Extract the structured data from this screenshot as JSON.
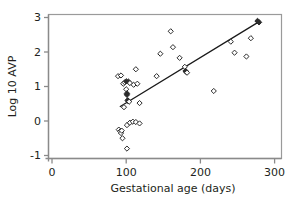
{
  "chart_data": {
    "type": "scatter",
    "title": "",
    "xlabel": "Gestational age (days)",
    "ylabel": "Log 10 AVP",
    "xlim": [
      0,
      310
    ],
    "ylim": [
      -1.35,
      3.2
    ],
    "xticks": [
      0,
      100,
      200,
      300
    ],
    "xticklabels": [
      "0",
      "100",
      "200",
      "300"
    ],
    "yticks": [
      -1,
      0,
      1,
      2,
      3
    ],
    "yticklabels": [
      "-1",
      "0",
      "1",
      "2",
      "3"
    ],
    "grid": false,
    "legend": null,
    "marker": "diamond-open",
    "series": [
      {
        "name": "AVP vs gestational age",
        "marker": "diamond",
        "points": [
          {
            "x": 89,
            "y": 1.3,
            "filled": false
          },
          {
            "x": 93,
            "y": 1.32,
            "filled": false
          },
          {
            "x": 96,
            "y": 1.08,
            "filled": false
          },
          {
            "x": 98,
            "y": 1.12,
            "filled": false
          },
          {
            "x": 100,
            "y": 1.15,
            "filled": true
          },
          {
            "x": 103,
            "y": 1.14,
            "filled": true
          },
          {
            "x": 105,
            "y": 1.1,
            "filled": false
          },
          {
            "x": 100,
            "y": 0.92,
            "filled": false
          },
          {
            "x": 101,
            "y": 0.8,
            "filled": true
          },
          {
            "x": 101,
            "y": 0.76,
            "filled": true
          },
          {
            "x": 102,
            "y": 0.6,
            "filled": true
          },
          {
            "x": 103,
            "y": 0.57,
            "filled": true
          },
          {
            "x": 104,
            "y": 0.56,
            "filled": false
          },
          {
            "x": 97,
            "y": 0.4,
            "filled": false
          },
          {
            "x": 110,
            "y": 1.05,
            "filled": false
          },
          {
            "x": 113,
            "y": 1.5,
            "filled": false
          },
          {
            "x": 115,
            "y": 1.08,
            "filled": false
          },
          {
            "x": 118,
            "y": 0.52,
            "filled": false
          },
          {
            "x": 141,
            "y": 1.3,
            "filled": false
          },
          {
            "x": 146,
            "y": 1.95,
            "filled": false
          },
          {
            "x": 160,
            "y": 2.6,
            "filled": false
          },
          {
            "x": 163,
            "y": 2.14,
            "filled": false
          },
          {
            "x": 172,
            "y": 1.83,
            "filled": false
          },
          {
            "x": 179,
            "y": 1.57,
            "filled": false
          },
          {
            "x": 180,
            "y": 1.45,
            "filled": true
          },
          {
            "x": 181,
            "y": 1.42,
            "filled": true
          },
          {
            "x": 182,
            "y": 1.4,
            "filled": false
          },
          {
            "x": 218,
            "y": 0.87,
            "filled": false
          },
          {
            "x": 241,
            "y": 2.3,
            "filled": false
          },
          {
            "x": 246,
            "y": 1.98,
            "filled": false
          },
          {
            "x": 262,
            "y": 1.87,
            "filled": false
          },
          {
            "x": 268,
            "y": 2.4,
            "filled": false
          },
          {
            "x": 277,
            "y": 2.9,
            "filled": true
          },
          {
            "x": 279,
            "y": 2.86,
            "filled": true
          },
          {
            "x": 90,
            "y": -0.25,
            "filled": false
          },
          {
            "x": 92,
            "y": -0.3,
            "filled": false
          },
          {
            "x": 93,
            "y": -0.35,
            "filled": false
          },
          {
            "x": 94,
            "y": -0.28,
            "filled": false
          },
          {
            "x": 95,
            "y": -0.5,
            "filled": false
          },
          {
            "x": 101,
            "y": -0.12,
            "filled": false
          },
          {
            "x": 105,
            "y": -0.05,
            "filled": false
          },
          {
            "x": 109,
            "y": -0.02,
            "filled": false
          },
          {
            "x": 113,
            "y": -0.03,
            "filled": false
          },
          {
            "x": 118,
            "y": -0.07,
            "filled": false
          },
          {
            "x": 101,
            "y": -0.8,
            "filled": false
          }
        ]
      }
    ],
    "fit_line": {
      "name": "regression-line",
      "x1": 92,
      "y1": 0.42,
      "x2": 277,
      "y2": 2.85
    }
  }
}
